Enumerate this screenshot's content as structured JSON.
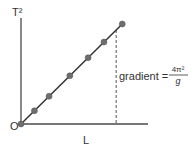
{
  "chart_data": {
    "type": "line",
    "title": "",
    "xlabel": "L",
    "ylabel": "T²",
    "origin_label": "O",
    "annotation": {
      "text": "gradient =",
      "fraction_numerator": "4π²",
      "fraction_denominator": "g"
    },
    "x_range": [
      0,
      10
    ],
    "y_range": [
      0,
      10
    ],
    "line": {
      "from": [
        0,
        0
      ],
      "to": [
        8.3,
        8.3
      ]
    },
    "points": [
      {
        "x": 0,
        "y": 0
      },
      {
        "x": 1.1,
        "y": 1.1
      },
      {
        "x": 2.3,
        "y": 2.3
      },
      {
        "x": 4.0,
        "y": 4.0
      },
      {
        "x": 5.5,
        "y": 5.5
      },
      {
        "x": 6.8,
        "y": 6.8
      },
      {
        "x": 8.3,
        "y": 8.3
      }
    ],
    "dashed_drop_x": 7.8,
    "colors": {
      "axis": "#4a4a4a",
      "line": "#333333",
      "point": "#6e6e6e",
      "dashed": "#555555",
      "text": "#333333"
    }
  }
}
